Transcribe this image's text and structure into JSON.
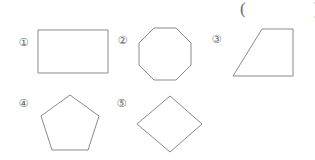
{
  "page": {
    "background_color": "#ffffff",
    "stroke_color": "#8a8a8a",
    "text_color": "#5f5f5f",
    "answer_blank": "(                )"
  },
  "options": [
    {
      "label": "①",
      "number": 1,
      "shape_name": "rectangle",
      "label_x": 16,
      "label_y": 35,
      "shape_x": 38,
      "shape_y": 30,
      "shape_w": 70,
      "shape_h": 43,
      "points": "0,0 70,0 70,43 0,43"
    },
    {
      "label": "②",
      "number": 2,
      "shape_name": "octagon",
      "label_x": 115,
      "label_y": 33,
      "shape_x": 139,
      "shape_y": 28,
      "shape_w": 52,
      "shape_h": 52,
      "points": "15,0 37,0 52,15 52,37 37,52 15,52 0,37 0,15"
    },
    {
      "label": "③",
      "number": 3,
      "shape_name": "trapezoid",
      "label_x": 209,
      "label_y": 32,
      "shape_x": 233,
      "shape_y": 29,
      "shape_w": 60,
      "shape_h": 47,
      "points": "29,0 60,0 60,47 0,47"
    },
    {
      "label": "④",
      "number": 4,
      "shape_name": "pentagon",
      "label_x": 16,
      "label_y": 96,
      "shape_x": 41,
      "shape_y": 95,
      "shape_w": 58,
      "shape_h": 55,
      "points": "29,0 58,21 47,55 11,55 0,21"
    },
    {
      "label": "⑤",
      "number": 5,
      "shape_name": "rhombus",
      "label_x": 114,
      "label_y": 96,
      "shape_x": 137,
      "shape_y": 96,
      "shape_w": 65,
      "shape_h": 56,
      "points": "33,0 65,28 33,56 0,28"
    }
  ]
}
